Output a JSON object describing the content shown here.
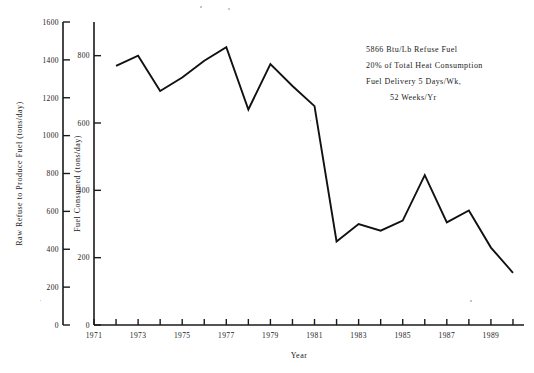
{
  "chart_data": {
    "type": "line",
    "title": "",
    "xlabel": "Year",
    "ylabel_left": "Raw Refuse to Produce Fuel (tons/day)",
    "ylabel_right": "Fuel Consumed (tons/day)",
    "xlim": [
      1971,
      1990.5
    ],
    "x_ticks": [
      1971,
      1972,
      1973,
      1974,
      1975,
      1976,
      1977,
      1978,
      1979,
      1980,
      1981,
      1982,
      1983,
      1984,
      1985,
      1986,
      1987,
      1988,
      1989,
      1990
    ],
    "x_tick_labels": [
      "1971",
      "",
      "1973",
      "",
      "1975",
      "",
      "1977",
      "",
      "1979",
      "",
      "1981",
      "",
      "1983",
      "",
      "1985",
      "",
      "1987",
      "",
      "1989",
      ""
    ],
    "left_axis": {
      "label": "Raw Refuse to Produce Fuel (tons/day)",
      "ylim": [
        0,
        1600
      ],
      "ticks": [
        0,
        200,
        400,
        600,
        800,
        1000,
        1200,
        1400,
        1600
      ],
      "tick_labels": [
        "0",
        "200",
        "400",
        "600",
        "800",
        "1000",
        "1200",
        "1400",
        "1600"
      ]
    },
    "right_axis": {
      "label": "Fuel Consumed (tons/day)",
      "ylim": [
        0,
        900
      ],
      "ticks": [
        0,
        200,
        400,
        600,
        800
      ],
      "tick_labels": [
        "0",
        "200",
        "400",
        "600",
        "800"
      ]
    },
    "grid": false,
    "legend": null,
    "series": [
      {
        "name": "Fuel Consumed",
        "axis": "right",
        "x": [
          1972,
          1973,
          1974,
          1975,
          1976,
          1977,
          1978,
          1979,
          1980,
          1981,
          1982,
          1983,
          1984,
          1985,
          1986,
          1987,
          1988,
          1989,
          1990
        ],
        "values": [
          770,
          800,
          695,
          735,
          785,
          825,
          640,
          775,
          710,
          650,
          248,
          300,
          280,
          310,
          445,
          305,
          340,
          230,
          155
        ]
      }
    ],
    "annotations": [
      "5866 Btu/Lb Refuse Fuel",
      "20% of Total Heat Consumption",
      "Fuel Delivery 5 Days/Wk,",
      "52 Weeks/Yr"
    ]
  },
  "colors": {
    "line": "#111111",
    "axis": "#1a1a1a",
    "background": "#ffffff"
  }
}
